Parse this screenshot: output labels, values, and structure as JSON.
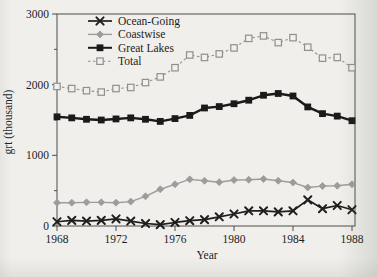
{
  "figure": {
    "background": "#f0efeb",
    "ink": "#1c1c1c",
    "frame_color": "#4d4d4d",
    "paper_marker_fill": "#f1f0ec"
  },
  "chart_data": {
    "type": "line",
    "title": "",
    "xlabel": "Year",
    "ylabel": "grt (thousand)",
    "x": [
      1968,
      1969,
      1970,
      1971,
      1972,
      1973,
      1974,
      1975,
      1976,
      1977,
      1978,
      1979,
      1980,
      1981,
      1982,
      1983,
      1984,
      1985,
      1986,
      1987,
      1988
    ],
    "xlim": [
      1968,
      1988
    ],
    "ylim": [
      0,
      3000
    ],
    "xticks": [
      1968,
      1972,
      1976,
      1980,
      1984,
      1988
    ],
    "yticks": [
      0,
      1000,
      2000,
      3000
    ],
    "yticks_minor": [
      500,
      1500,
      2500
    ],
    "grid": false,
    "legend_position": "top-left-inside",
    "series": [
      {
        "name": "Ocean-Going",
        "marker": "x",
        "color": "#1e1e1e",
        "line_style": "solid",
        "line_width": 1.7,
        "values": [
          60,
          80,
          70,
          80,
          100,
          70,
          35,
          20,
          50,
          75,
          90,
          130,
          170,
          215,
          215,
          200,
          215,
          370,
          245,
          290,
          230
        ]
      },
      {
        "name": "Coastwise",
        "marker": "diamond",
        "color": "#9c9c9c",
        "line_style": "solid",
        "line_width": 1.4,
        "values": [
          330,
          330,
          335,
          335,
          330,
          345,
          420,
          520,
          590,
          660,
          640,
          620,
          650,
          655,
          665,
          640,
          615,
          545,
          565,
          570,
          590
        ]
      },
      {
        "name": "Great Lakes",
        "marker": "square-filled",
        "color": "#1a1a1a",
        "line_style": "solid",
        "line_width": 2.4,
        "values": [
          1545,
          1530,
          1510,
          1500,
          1515,
          1530,
          1510,
          1480,
          1520,
          1565,
          1670,
          1690,
          1730,
          1780,
          1850,
          1875,
          1840,
          1685,
          1590,
          1555,
          1490
        ]
      },
      {
        "name": "Total",
        "marker": "square-open",
        "color": "#8f8f8f",
        "line_style": "dashed",
        "line_width": 1.1,
        "values": [
          1975,
          1945,
          1915,
          1895,
          1945,
          1960,
          2030,
          2110,
          2240,
          2420,
          2385,
          2435,
          2520,
          2655,
          2690,
          2595,
          2665,
          2530,
          2375,
          2385,
          2240
        ]
      }
    ]
  }
}
